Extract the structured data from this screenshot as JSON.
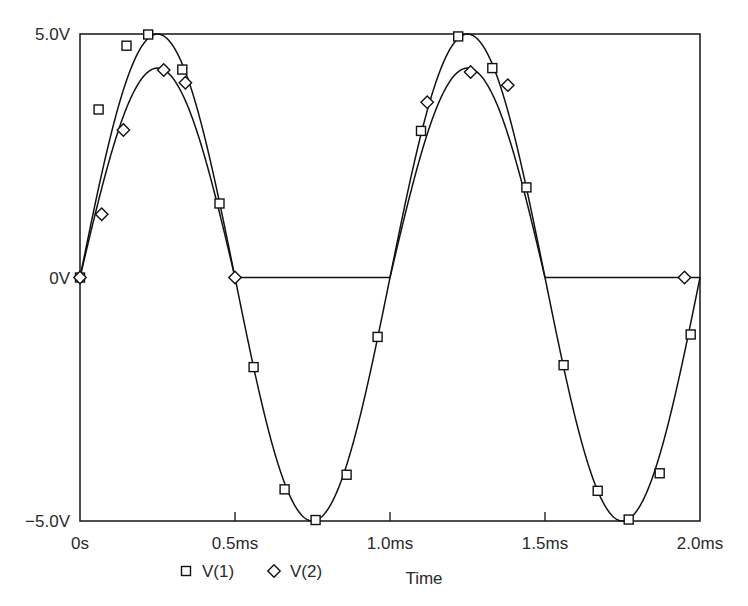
{
  "chart_data": {
    "type": "line",
    "title": "",
    "xlabel": "Time",
    "ylabel": "",
    "grid": false,
    "legend_position": "bottom-left",
    "xlim": [
      0,
      2.0
    ],
    "ylim": [
      -5.0,
      5.0
    ],
    "x_unit": "ms",
    "y_unit": "V",
    "xticks": [
      0,
      0.5,
      1.0,
      1.5,
      2.0
    ],
    "xtick_labels": [
      "0s",
      "0.5ms",
      "1.0ms",
      "1.5ms",
      "2.0ms"
    ],
    "yticks": [
      5.0,
      0,
      -5.0
    ],
    "ytick_labels": [
      "5.0V",
      "0V",
      "-5.0V"
    ],
    "series": [
      {
        "name": "V(1)",
        "marker": "square",
        "description": "full sine wave, 5V amplitude, 1ms period",
        "waveform": "sine",
        "amplitude": 5.0,
        "period_ms": 1.0,
        "phase": 0,
        "marker_points": [
          {
            "x": 0.0,
            "y": 0.0
          },
          {
            "x": 0.06,
            "y": 3.45
          },
          {
            "x": 0.15,
            "y": 4.76
          },
          {
            "x": 0.22,
            "y": 4.99
          },
          {
            "x": 0.33,
            "y": 4.27
          },
          {
            "x": 0.45,
            "y": 1.52
          },
          {
            "x": 0.56,
            "y": -1.84
          },
          {
            "x": 0.66,
            "y": -4.35
          },
          {
            "x": 0.76,
            "y": -4.98
          },
          {
            "x": 0.86,
            "y": -4.05
          },
          {
            "x": 0.96,
            "y": -1.22
          },
          {
            "x": 1.1,
            "y": 3.01
          },
          {
            "x": 1.22,
            "y": 4.95
          },
          {
            "x": 1.33,
            "y": 4.3
          },
          {
            "x": 1.44,
            "y": 1.85
          },
          {
            "x": 1.56,
            "y": -1.8
          },
          {
            "x": 1.67,
            "y": -4.38
          },
          {
            "x": 1.77,
            "y": -4.97
          },
          {
            "x": 1.87,
            "y": -4.02
          },
          {
            "x": 1.97,
            "y": -1.17
          }
        ]
      },
      {
        "name": "V(2)",
        "marker": "diamond",
        "description": "half-wave rectified sine, clamped to 0V on negative half-cycles, peak about 4.3V",
        "waveform": "half-wave-rectified-sine",
        "amplitude": 4.3,
        "period_ms": 1.0,
        "clamp_level": 0.0,
        "marker_points": [
          {
            "x": 0.0,
            "y": 0.0
          },
          {
            "x": 0.07,
            "y": 1.3
          },
          {
            "x": 0.14,
            "y": 3.03
          },
          {
            "x": 0.27,
            "y": 4.26
          },
          {
            "x": 0.34,
            "y": 4.0
          },
          {
            "x": 0.5,
            "y": 0.0
          },
          {
            "x": 1.12,
            "y": 3.6
          },
          {
            "x": 1.26,
            "y": 4.22
          },
          {
            "x": 1.38,
            "y": 3.95
          },
          {
            "x": 1.95,
            "y": 0.0
          }
        ]
      }
    ],
    "legend": [
      {
        "label": "V(1)",
        "marker": "square"
      },
      {
        "label": "V(2)",
        "marker": "diamond"
      }
    ]
  }
}
